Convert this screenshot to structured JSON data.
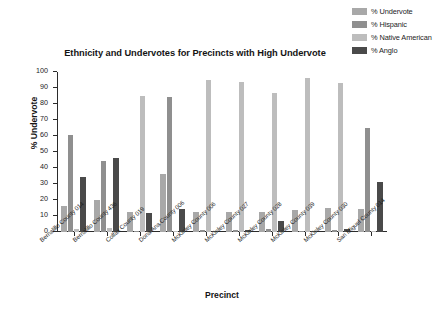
{
  "chart_data": {
    "type": "bar",
    "title": "Ethnicity and Undervotes for Precincts with  High Undervote",
    "xlabel": "Precinct",
    "ylabel": "%  Undervote",
    "ylim": [
      0,
      100
    ],
    "yticks": [
      0,
      10,
      20,
      30,
      40,
      50,
      60,
      70,
      80,
      90,
      100
    ],
    "grid": false,
    "legend_position": "top-right",
    "categories": [
      "Bernalillo County 014",
      "Bernalillo County 436",
      "Colfax County 019",
      "Dona Ana County 006",
      "McKinley County 006",
      "McKinley County 027",
      "McKinley County 028",
      "McKinley County 039",
      "McKinley County 030",
      "San Miguel County 014"
    ],
    "series": [
      {
        "name": "% Undervote",
        "color": "#a8a8a8",
        "values": [
          16,
          19.7,
          12.8,
          36.2,
          12.6,
          12.6,
          12.4,
          14,
          15.1,
          14.2
        ]
      },
      {
        "name": "% Hispanic",
        "color": "#8f8f8f",
        "values": [
          60.5,
          44.1,
          0.6,
          84.5,
          1.5,
          1,
          2.1,
          0.5,
          1.4,
          65
        ]
      },
      {
        "name": "% Native American",
        "color": "#bdbdbd",
        "values": [
          2,
          2.8,
          85.2,
          0.4,
          95,
          94,
          87,
          96.3,
          93.4,
          0.5
        ]
      },
      {
        "name": "% Anglo",
        "color": "#4a4a4a",
        "values": [
          34.5,
          46,
          12,
          14.1,
          0.5,
          1.5,
          6.8,
          0.2,
          1.8,
          31
        ]
      }
    ]
  },
  "legend": {
    "items": [
      {
        "label": "% Undervote",
        "color": "#a8a8a8"
      },
      {
        "label": "% Hispanic",
        "color": "#8f8f8f"
      },
      {
        "label": "% Native American",
        "color": "#bdbdbd"
      },
      {
        "label": "% Anglo",
        "color": "#4a4a4a"
      }
    ]
  }
}
